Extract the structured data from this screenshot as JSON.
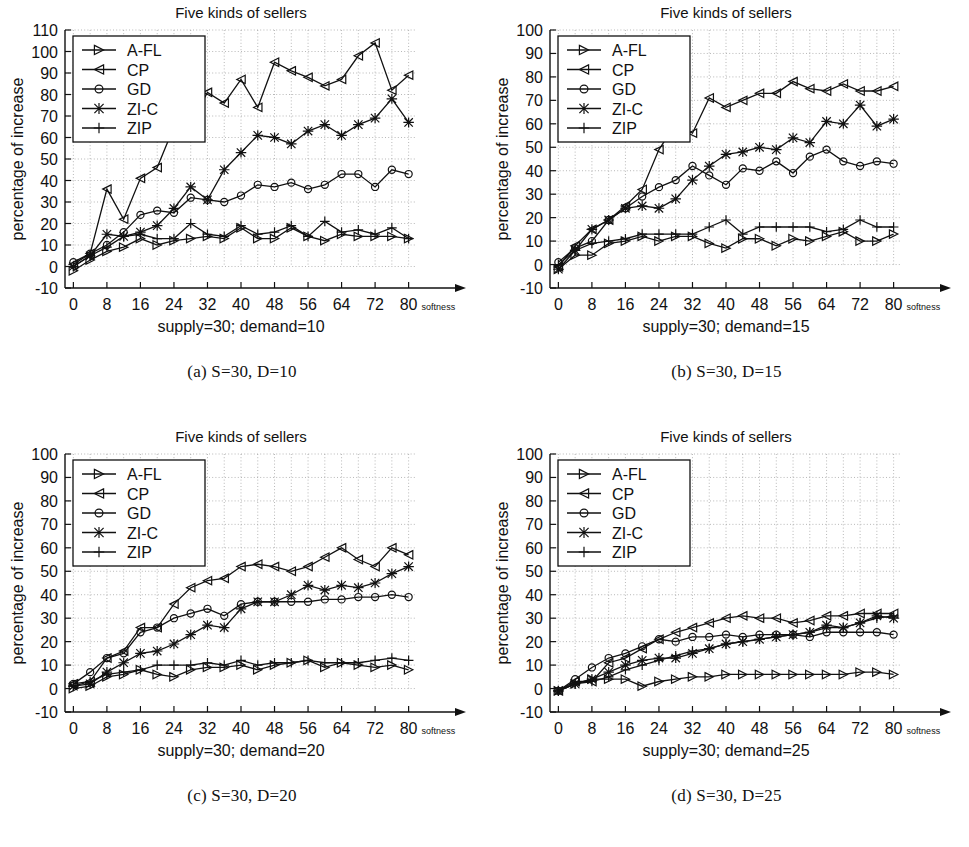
{
  "figure": {
    "panel_captions": [
      "(a) S=30, D=10",
      "(b) S=30, D=15",
      "(c) S=30, D=20",
      "(d) S=30, D=25"
    ]
  },
  "chart_data": [
    {
      "id": "panel-a",
      "type": "line",
      "title": "Five kinds of sellers",
      "xlabel": "supply=30; demand=10",
      "ylabel": "percentage of increase",
      "x_unit_label": "softness",
      "xlim": [
        -2,
        82
      ],
      "ylim": [
        -10,
        110
      ],
      "xticks": [
        0,
        8,
        16,
        24,
        32,
        40,
        48,
        56,
        64,
        72,
        80
      ],
      "yticks": [
        -10,
        0,
        10,
        20,
        30,
        40,
        50,
        60,
        70,
        80,
        90,
        100,
        110
      ],
      "grid": true,
      "legend_position": "top-left",
      "x": [
        0,
        4,
        8,
        12,
        16,
        20,
        24,
        28,
        32,
        36,
        40,
        44,
        48,
        52,
        56,
        60,
        64,
        68,
        72,
        76,
        80
      ],
      "series": [
        {
          "name": "A-FL",
          "marker": "right-triangle",
          "values": [
            -2,
            3,
            7,
            9,
            13,
            10,
            12,
            13,
            14,
            13,
            18,
            13,
            13,
            18,
            14,
            12,
            15,
            14,
            14,
            14,
            13
          ]
        },
        {
          "name": "CP",
          "marker": "left-triangle",
          "values": [
            1,
            6,
            36,
            22,
            41,
            46,
            65,
            67,
            81,
            76,
            87,
            74,
            95,
            91,
            88,
            84,
            87,
            98,
            104,
            82,
            89
          ]
        },
        {
          "name": "GD",
          "marker": "circle",
          "values": [
            2,
            6,
            10,
            16,
            24,
            26,
            25,
            32,
            31,
            30,
            33,
            38,
            37,
            39,
            36,
            38,
            43,
            43,
            37,
            45,
            43
          ]
        },
        {
          "name": "ZI-C",
          "marker": "star",
          "values": [
            0,
            5,
            15,
            14,
            16,
            19,
            27,
            37,
            31,
            45,
            53,
            61,
            60,
            57,
            63,
            66,
            61,
            66,
            69,
            78,
            67
          ]
        },
        {
          "name": "ZIP",
          "marker": "plus",
          "values": [
            0,
            5,
            9,
            14,
            15,
            13,
            13,
            20,
            15,
            14,
            19,
            15,
            16,
            19,
            14,
            21,
            16,
            17,
            15,
            18,
            13
          ]
        }
      ]
    },
    {
      "id": "panel-b",
      "type": "line",
      "title": "Five kinds of sellers",
      "xlabel": "supply=30; demand=15",
      "ylabel": "percentage of increase",
      "x_unit_label": "softness",
      "xlim": [
        -2,
        82
      ],
      "ylim": [
        -10,
        100
      ],
      "xticks": [
        0,
        8,
        16,
        24,
        32,
        40,
        48,
        56,
        64,
        72,
        80
      ],
      "yticks": [
        -10,
        0,
        10,
        20,
        30,
        40,
        50,
        60,
        70,
        80,
        90,
        100
      ],
      "grid": true,
      "legend_position": "top-left",
      "x": [
        0,
        4,
        8,
        12,
        16,
        20,
        24,
        28,
        32,
        36,
        40,
        44,
        48,
        52,
        56,
        60,
        64,
        68,
        72,
        76,
        80
      ],
      "series": [
        {
          "name": "A-FL",
          "marker": "right-triangle",
          "values": [
            -2,
            4,
            4,
            9,
            10,
            12,
            10,
            12,
            12,
            9,
            7,
            11,
            11,
            8,
            11,
            10,
            12,
            14,
            10,
            10,
            13
          ]
        },
        {
          "name": "CP",
          "marker": "left-triangle",
          "values": [
            -1,
            8,
            15,
            19,
            25,
            32,
            49,
            60,
            56,
            71,
            67,
            70,
            73,
            73,
            78,
            75,
            74,
            77,
            74,
            74,
            76
          ]
        },
        {
          "name": "GD",
          "marker": "circle",
          "values": [
            1,
            7,
            10,
            19,
            24,
            29,
            33,
            36,
            42,
            38,
            34,
            41,
            40,
            44,
            39,
            46,
            49,
            44,
            42,
            44,
            43
          ]
        },
        {
          "name": "ZI-C",
          "marker": "star",
          "values": [
            -2,
            6,
            15,
            19,
            24,
            25,
            24,
            28,
            36,
            42,
            47,
            48,
            50,
            49,
            54,
            52,
            61,
            60,
            68,
            59,
            62
          ]
        },
        {
          "name": "ZIP",
          "marker": "plus",
          "values": [
            0,
            6,
            9,
            10,
            11,
            13,
            13,
            13,
            13,
            16,
            19,
            13,
            16,
            16,
            16,
            16,
            14,
            15,
            19,
            16,
            16
          ]
        }
      ]
    },
    {
      "id": "panel-c",
      "type": "line",
      "title": "Five kinds of sellers",
      "xlabel": "supply=30; demand=20",
      "ylabel": "percentage of increase",
      "x_unit_label": "softness",
      "xlim": [
        -2,
        82
      ],
      "ylim": [
        -10,
        100
      ],
      "xticks": [
        0,
        8,
        16,
        24,
        32,
        40,
        48,
        56,
        64,
        72,
        80
      ],
      "yticks": [
        -10,
        0,
        10,
        20,
        30,
        40,
        50,
        60,
        70,
        80,
        90,
        100
      ],
      "grid": true,
      "legend_position": "top-left",
      "x": [
        0,
        4,
        8,
        12,
        16,
        20,
        24,
        28,
        32,
        36,
        40,
        44,
        48,
        52,
        56,
        60,
        64,
        68,
        72,
        76,
        80
      ],
      "series": [
        {
          "name": "A-FL",
          "marker": "right-triangle",
          "values": [
            0,
            1,
            5,
            6,
            8,
            6,
            5,
            8,
            9,
            9,
            10,
            8,
            10,
            11,
            12,
            9,
            11,
            10,
            9,
            10,
            8
          ]
        },
        {
          "name": "CP",
          "marker": "left-triangle",
          "values": [
            2,
            3,
            13,
            16,
            26,
            26,
            36,
            43,
            46,
            47,
            52,
            53,
            52,
            50,
            52,
            56,
            60,
            55,
            52,
            60,
            57
          ]
        },
        {
          "name": "GD",
          "marker": "circle",
          "values": [
            2,
            7,
            13,
            15,
            24,
            26,
            30,
            32,
            34,
            31,
            36,
            37,
            37,
            37,
            37,
            38,
            38,
            39,
            39,
            40,
            39
          ]
        },
        {
          "name": "ZI-C",
          "marker": "star",
          "values": [
            1,
            2,
            7,
            11,
            15,
            16,
            19,
            23,
            27,
            26,
            34,
            37,
            37,
            40,
            44,
            42,
            44,
            43,
            45,
            49,
            52
          ]
        },
        {
          "name": "ZIP",
          "marker": "plus",
          "values": [
            1,
            3,
            6,
            7,
            8,
            10,
            10,
            10,
            11,
            10,
            12,
            10,
            11,
            11,
            12,
            11,
            11,
            11,
            12,
            13,
            12
          ]
        }
      ]
    },
    {
      "id": "panel-d",
      "type": "line",
      "title": "Five kinds of sellers",
      "xlabel": "supply=30; demand=25",
      "ylabel": "percentage of increase",
      "x_unit_label": "softness",
      "xlim": [
        -2,
        82
      ],
      "ylim": [
        -10,
        100
      ],
      "xticks": [
        0,
        8,
        16,
        24,
        32,
        40,
        48,
        56,
        64,
        72,
        80
      ],
      "yticks": [
        -10,
        0,
        10,
        20,
        30,
        40,
        50,
        60,
        70,
        80,
        90,
        100
      ],
      "grid": true,
      "legend_position": "top-left",
      "x": [
        0,
        4,
        8,
        12,
        16,
        20,
        24,
        28,
        32,
        36,
        40,
        44,
        48,
        52,
        56,
        60,
        64,
        68,
        72,
        76,
        80
      ],
      "series": [
        {
          "name": "A-FL",
          "marker": "right-triangle",
          "values": [
            -1,
            2,
            4,
            4,
            4,
            1,
            3,
            4,
            5,
            5,
            6,
            6,
            6,
            6,
            6,
            6,
            6,
            6,
            7,
            7,
            6
          ]
        },
        {
          "name": "CP",
          "marker": "left-triangle",
          "values": [
            -1,
            3,
            3,
            11,
            13,
            17,
            21,
            24,
            26,
            28,
            30,
            31,
            30,
            30,
            28,
            29,
            31,
            31,
            32,
            32,
            32
          ]
        },
        {
          "name": "GD",
          "marker": "circle",
          "values": [
            -1,
            4,
            9,
            13,
            15,
            18,
            21,
            20,
            22,
            22,
            23,
            22,
            23,
            23,
            23,
            22,
            24,
            24,
            24,
            24,
            23
          ]
        },
        {
          "name": "ZI-C",
          "marker": "star",
          "values": [
            -1,
            2,
            4,
            7,
            10,
            12,
            13,
            13,
            15,
            17,
            19,
            20,
            21,
            22,
            23,
            24,
            27,
            26,
            28,
            31,
            30
          ]
        },
        {
          "name": "ZIP",
          "marker": "plus",
          "values": [
            -1,
            2,
            3,
            5,
            8,
            10,
            12,
            14,
            16,
            17,
            19,
            20,
            21,
            22,
            23,
            24,
            26,
            26,
            28,
            30,
            31
          ]
        }
      ]
    }
  ]
}
